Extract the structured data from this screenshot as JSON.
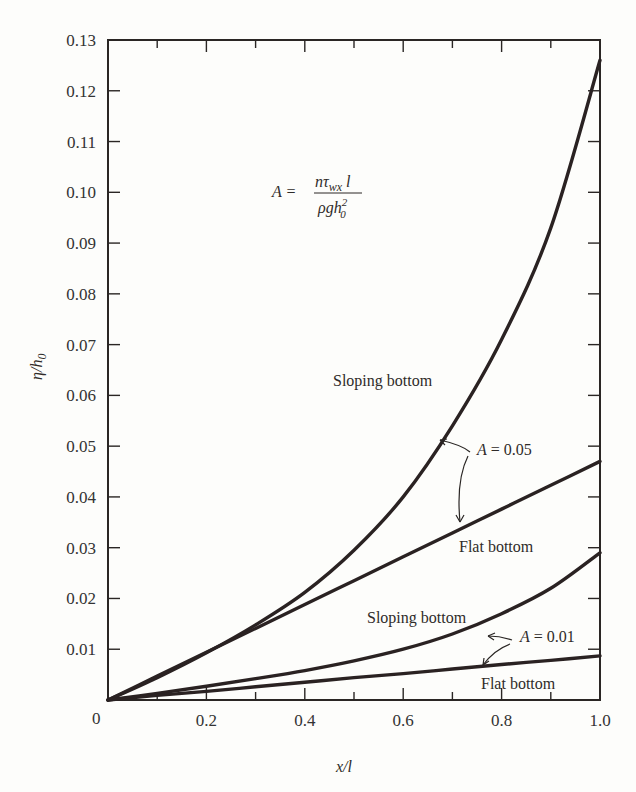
{
  "chart_data": {
    "type": "line",
    "title": "",
    "xlabel": "x/l",
    "ylabel": "η/h₀",
    "xlim": [
      0,
      1.0
    ],
    "ylim": [
      0,
      0.13
    ],
    "x_ticks": [
      "0",
      "0.2",
      "0.4",
      "0.6",
      "0.8",
      "1.0"
    ],
    "y_ticks": [
      "0.01",
      "0.02",
      "0.03",
      "0.04",
      "0.05",
      "0.06",
      "0.07",
      "0.08",
      "0.09",
      "0.10",
      "0.11",
      "0.12",
      "0.13"
    ],
    "grid": false,
    "x": [
      0,
      0.1,
      0.2,
      0.3,
      0.4,
      0.5,
      0.6,
      0.7,
      0.8,
      0.9,
      1.0
    ],
    "series": [
      {
        "name": "Sloping bottom, A = 0.05",
        "values": [
          0,
          0.0044,
          0.0093,
          0.0148,
          0.0212,
          0.0295,
          0.04,
          0.054,
          0.071,
          0.093,
          0.126
        ]
      },
      {
        "name": "Flat bottom, A = 0.05",
        "values": [
          0,
          0.0047,
          0.0094,
          0.0141,
          0.0188,
          0.0235,
          0.0282,
          0.0329,
          0.0376,
          0.0423,
          0.047
        ]
      },
      {
        "name": "Sloping bottom, A = 0.01",
        "values": [
          0,
          0.0013,
          0.0027,
          0.0042,
          0.0058,
          0.0077,
          0.01,
          0.013,
          0.017,
          0.022,
          0.029
        ]
      },
      {
        "name": "Flat bottom, A = 0.01",
        "values": [
          0,
          0.0009,
          0.0017,
          0.0026,
          0.0035,
          0.0044,
          0.0052,
          0.0061,
          0.007,
          0.0078,
          0.0087
        ]
      }
    ],
    "annotations": [
      {
        "text": "A = nτ_wx l / (ρ g h₀²)",
        "role": "formula"
      },
      {
        "text": "Sloping bottom",
        "series": 0
      },
      {
        "text": "A = 0.05",
        "series": [
          0,
          1
        ]
      },
      {
        "text": "Flat bottom",
        "series": 1
      },
      {
        "text": "Sloping bottom",
        "series": 2
      },
      {
        "text": "A = 0.01",
        "series": [
          2,
          3
        ]
      },
      {
        "text": "Flat bottom",
        "series": 3
      }
    ]
  },
  "labels": {
    "formula_lhs": "A =",
    "formula_num_n": "nτ",
    "formula_num_sub": "wx",
    "formula_num_l": " l",
    "formula_den": "ρgh",
    "formula_den_sup": "2",
    "formula_den_sub": "0",
    "sloping_05": "Sloping bottom",
    "a_05": "A = 0.05",
    "flat_05": "Flat bottom",
    "sloping_01": "Sloping bottom",
    "a_01": "A = 0.01",
    "flat_01": "Flat bottom",
    "origin": "0",
    "xlabel": "x/l",
    "ylabel_eta": "η/h",
    "ylabel_sub": "0"
  }
}
